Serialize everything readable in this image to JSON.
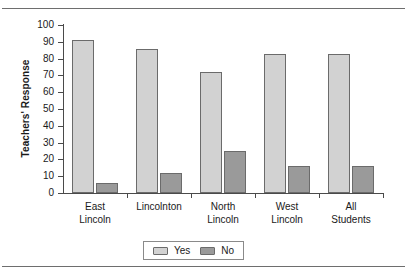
{
  "chart_data": {
    "type": "bar",
    "title": "",
    "xlabel": "",
    "ylabel": "Teachers' Response",
    "ylim": [
      0,
      100
    ],
    "yticks": [
      0,
      10,
      20,
      30,
      40,
      50,
      60,
      70,
      80,
      90,
      100
    ],
    "grid": false,
    "legend_position": "bottom-center",
    "categories": [
      "East Lincoln",
      "Lincolnton",
      "North Lincoln",
      "West Lincoln",
      "All Students"
    ],
    "category_lines": [
      [
        "East",
        "Lincoln"
      ],
      [
        "Lincolnton",
        ""
      ],
      [
        "North",
        "Lincoln"
      ],
      [
        "West",
        "Lincoln"
      ],
      [
        "All",
        "Students"
      ]
    ],
    "series": [
      {
        "name": "Yes",
        "color": "#d2d2d2",
        "values": [
          91,
          86,
          72,
          83,
          83
        ]
      },
      {
        "name": "No",
        "color": "#9a9a9a",
        "values": [
          6,
          12,
          25,
          16,
          16
        ]
      }
    ]
  },
  "legend": {
    "items": [
      {
        "label": "Yes"
      },
      {
        "label": "No"
      }
    ]
  },
  "colors": {
    "yes": "#d2d2d2",
    "no": "#9a9a9a",
    "axis": "#4a4a4a",
    "bar_outline": "#6b6b6b",
    "rule": "#6e6e6e"
  }
}
